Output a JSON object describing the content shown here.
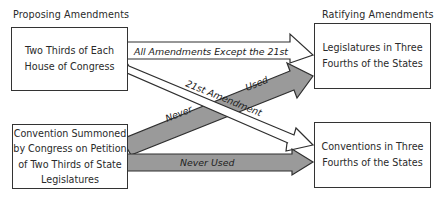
{
  "headers": {
    "left": "Proposing Amendments",
    "right": "Ratifying Amendments"
  },
  "nodes": {
    "congress": [
      "Two Thirds of Each",
      "House of Congress"
    ],
    "convention_summoned": [
      "Convention Summoned",
      "by Congress on Petition",
      "of Two Thirds of State",
      "Legislatures"
    ],
    "legislatures": [
      "Legislatures in Three",
      "Fourths of the States"
    ],
    "conventions": [
      "Conventions in Three",
      "Fourths of the States"
    ]
  },
  "edges": {
    "congress_to_legislatures": "All Amendments Except the 21st",
    "congress_to_conventions": "21st Amendment",
    "convention_to_legislatures_a": "Never",
    "convention_to_legislatures_b": "Used",
    "convention_to_conventions": "Never Used"
  },
  "colors": {
    "used_arrow_fill": "#ffffff",
    "never_used_arrow_fill": "#9a9a9a",
    "stroke": "#2f2f2f"
  }
}
